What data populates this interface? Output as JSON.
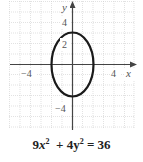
{
  "figure": {
    "equation": {
      "term1_coef": "9",
      "term1_var": "x",
      "term1_exp": "2",
      "plus": "+",
      "term2_coef": "4",
      "term2_var": "y",
      "term2_exp": "2",
      "equals": "=",
      "rhs": "36",
      "full_text": "9x² + 4y² = 36"
    },
    "axes": {
      "x_label": "x",
      "y_label": "y",
      "x_ticks": [
        "−4",
        "4"
      ],
      "y_ticks": [
        "4",
        "2",
        "−4"
      ],
      "x_range": [
        -6,
        6
      ],
      "y_range": [
        -6,
        6
      ]
    },
    "curve": {
      "type": "ellipse",
      "center": [
        0,
        0
      ],
      "semi_axis_x": 2,
      "semi_axis_y": 3,
      "color": "#1a1a1a"
    },
    "grid": {
      "on": true,
      "color": "#c8c8c8"
    }
  }
}
